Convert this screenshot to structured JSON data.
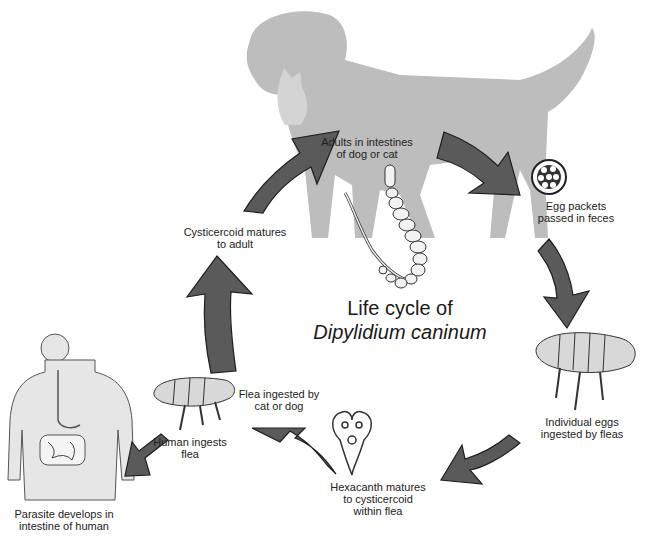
{
  "diagram": {
    "title_line1": "Life cycle of",
    "title_line2": "Dipylidium caninum",
    "stages": [
      {
        "id": "adults",
        "line1": "Adults in intestines",
        "line2": "of dog or cat"
      },
      {
        "id": "egg-packets",
        "line1": "Egg packets",
        "line2": "passed in feces"
      },
      {
        "id": "eggs-ingested",
        "line1": "Individual eggs",
        "line2": "ingested by fleas"
      },
      {
        "id": "hexacanth",
        "line1": "Hexacanth matures",
        "line2": "to cysticercoid",
        "line3": "within flea"
      },
      {
        "id": "flea-ingested",
        "line1": "Flea ingested by",
        "line2": "cat or dog"
      },
      {
        "id": "human-ingests",
        "line1": "Human ingests",
        "line2": "flea"
      },
      {
        "id": "parasite-human",
        "line1": "Parasite develops in",
        "line2": "intestine of human"
      },
      {
        "id": "cysticercoid-matures",
        "line1": "Cysticercoid matures",
        "line2": "to adult"
      }
    ],
    "colors": {
      "arrow_fill": "#5a5a5a",
      "arrow_stroke": "#1e1e1e",
      "silhouette": "#bdbdbd",
      "human_fill": "#e6e6e6",
      "text": "#222222"
    }
  }
}
